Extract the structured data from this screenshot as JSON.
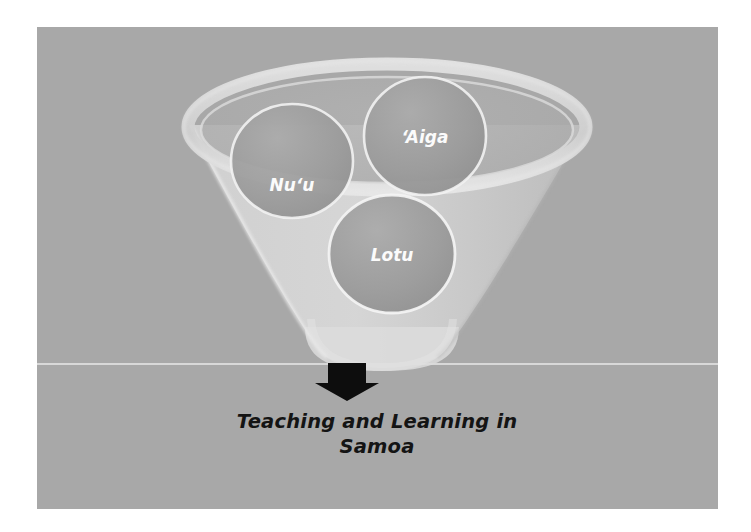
{
  "slide": {
    "background_color": "#a8a8a8",
    "border_color": "#ffffff"
  },
  "diagram": {
    "type": "funnel-with-spheres",
    "container_shape_name": "funnel-cone",
    "container_rim_name": "funnel-rim-ellipse",
    "container_fill_color": "#c9c9c9",
    "container_rim_color": "#d8d8d8",
    "sphere_fill_color": "#9a9a9a",
    "sphere_outline_color": "#ffffff",
    "spheres": [
      {
        "id": "nuu",
        "label": "Nu‘u",
        "cx": 255,
        "cy": 134,
        "rx": 61,
        "ry": 57
      },
      {
        "id": "aiga",
        "label": "‘Aiga",
        "cx": 388,
        "cy": 109,
        "rx": 61,
        "ry": 59
      },
      {
        "id": "lotu",
        "label": "Lotu",
        "cx": 355,
        "cy": 227,
        "rx": 63,
        "ry": 59
      }
    ]
  },
  "arrow": {
    "name": "down-arrow",
    "color": "#0d0d0d",
    "direction": "down"
  },
  "caption": {
    "line1": "Teaching and Learning in",
    "line2": "Samoa",
    "full_text": "Teaching and Learning in Samoa",
    "color": "#141414"
  }
}
